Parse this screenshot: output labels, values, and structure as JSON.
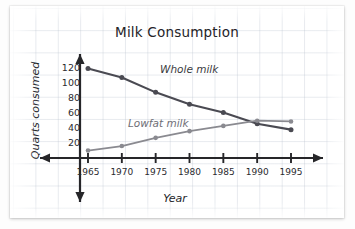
{
  "chart_data": {
    "type": "line",
    "title": "Milk Consumption",
    "xlabel": "Year",
    "ylabel": "Quarts consumed",
    "x": [
      1965,
      1970,
      1975,
      1980,
      1985,
      1990,
      1995
    ],
    "xticklabels": [
      "1965",
      "1970",
      "1975",
      "1980",
      "1985",
      "1990",
      "1995"
    ],
    "yticks": [
      20,
      40,
      60,
      80,
      100,
      120
    ],
    "yticklabels": [
      "20",
      "40",
      "60",
      "80",
      "100",
      "120"
    ],
    "xlim": [
      1962.5,
      1997.5
    ],
    "ylim": [
      0,
      130
    ],
    "grid": "graph-paper-background",
    "legend": "inline-labels",
    "series": [
      {
        "name": "Whole milk",
        "color": "#4a4a52",
        "values": [
          120,
          108,
          88,
          72,
          61,
          46,
          38
        ]
      },
      {
        "name": "Lowfat milk",
        "color": "#8a8a90",
        "values": [
          10,
          16,
          27,
          36,
          43,
          50,
          49
        ]
      }
    ],
    "annotations": [
      {
        "text": "Whole milk",
        "series": "Whole milk"
      },
      {
        "text": "Lowfat milk",
        "series": "Lowfat milk"
      }
    ]
  },
  "axes": {
    "axis_color": "#262629",
    "arrow_ends": [
      "left",
      "right",
      "up",
      "down"
    ]
  }
}
